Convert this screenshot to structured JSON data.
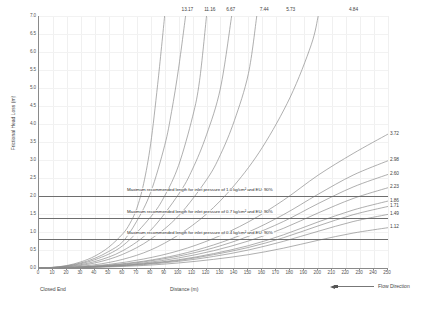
{
  "chart": {
    "type": "line",
    "title": "",
    "xlabel": "Distance (m)",
    "ylabel": "Frictional Head Loss (m)",
    "closed_end_label": "Closed End",
    "xlim": [
      0,
      250
    ],
    "ylim": [
      0,
      7.0
    ],
    "xticks": [
      0,
      10,
      20,
      30,
      40,
      50,
      60,
      70,
      80,
      90,
      100,
      110,
      120,
      130,
      140,
      150,
      160,
      170,
      180,
      190,
      200,
      210,
      220,
      230,
      240,
      250
    ],
    "yticks": [
      "0.0",
      "0.5",
      "1.0",
      "1.5",
      "2.0",
      "2.5",
      "3.0",
      "3.5",
      "4.0",
      "4.5",
      "5.0",
      "5.5",
      "6.0",
      "6.5",
      "7.0"
    ],
    "grid": true,
    "legend_position": "bottom-right",
    "legend": [
      {
        "label": "Flow Direction",
        "icon": "left-arrow-line"
      }
    ],
    "line_color": "#8c8c8c",
    "threshold_color": "#6e6e6e",
    "axis_color": "#8a8a8a",
    "grid_color": "#f0f0f0"
  },
  "chart_data": {
    "type": "line",
    "title": "",
    "xlabel": "Distance (m)",
    "ylabel": "Frictional Head Loss (m)",
    "xlim": [
      0,
      250
    ],
    "ylim": [
      0,
      7.0
    ],
    "grid": true,
    "legend_position": "bottom-right",
    "annotations": [
      {
        "text": "Maximum recommended length for inlet pressure of 1.0 kg/cm² and EU: 90%",
        "y": 2.0,
        "type": "hline"
      },
      {
        "text": "Maximum recommended length for inlet pressure of 0.7 kg/cm² and EU: 90%",
        "y": 1.4,
        "type": "hline"
      },
      {
        "text": "Maximum recommended length for inlet pressure of 0.4 kg/cm² and EU: 90%",
        "y": 0.8,
        "type": "hline"
      }
    ],
    "end_labels_top": [
      "13.17",
      "11.16",
      "6.67",
      "7.44",
      "5.73",
      "4.84"
    ],
    "end_labels_right": [
      "3.72",
      "2.98",
      "2.60",
      "2.23",
      "1.86",
      "1.71",
      "1.49",
      "1.12"
    ],
    "series": [
      {
        "name": "13.17",
        "exit": "top",
        "exit_x": 107,
        "x": [
          0,
          10,
          20,
          30,
          40,
          50,
          60,
          65,
          70,
          75,
          80,
          85,
          90
        ],
        "values": [
          0,
          0.02,
          0.07,
          0.17,
          0.33,
          0.58,
          0.95,
          1.23,
          1.65,
          2.35,
          3.45,
          5.1,
          7.0
        ]
      },
      {
        "name": "11.16",
        "exit": "top",
        "exit_x": 123,
        "x": [
          0,
          10,
          20,
          30,
          40,
          50,
          60,
          70,
          80,
          90,
          95,
          100,
          105
        ],
        "values": [
          0,
          0.015,
          0.06,
          0.14,
          0.27,
          0.46,
          0.73,
          1.3,
          2.1,
          3.4,
          4.35,
          5.55,
          7.0
        ]
      },
      {
        "name": "6.67",
        "exit": "top",
        "exit_x": 138,
        "x": [
          0,
          20,
          40,
          60,
          80,
          90,
          100,
          110,
          115,
          120
        ],
        "values": [
          0,
          0.05,
          0.23,
          0.62,
          1.42,
          2.0,
          2.85,
          4.2,
          5.2,
          7.0
        ]
      },
      {
        "name": "7.44",
        "exit": "top",
        "exit_x": 162,
        "x": [
          0,
          20,
          40,
          60,
          80,
          100,
          110,
          120,
          130,
          138
        ],
        "values": [
          0,
          0.04,
          0.18,
          0.48,
          1.05,
          2.05,
          2.75,
          3.7,
          5.0,
          7.0
        ]
      },
      {
        "name": "5.73",
        "exit": "top",
        "exit_x": 181,
        "x": [
          0,
          20,
          40,
          60,
          80,
          100,
          120,
          130,
          140,
          150,
          156
        ],
        "values": [
          0,
          0.03,
          0.14,
          0.38,
          0.8,
          1.45,
          2.45,
          3.15,
          4.1,
          5.4,
          7.0
        ]
      },
      {
        "name": "4.84",
        "exit": "top",
        "exit_x": 226,
        "x": [
          0,
          20,
          40,
          60,
          80,
          100,
          120,
          140,
          160,
          180,
          195,
          200
        ],
        "values": [
          0,
          0.02,
          0.09,
          0.24,
          0.5,
          0.92,
          1.5,
          2.3,
          3.35,
          4.75,
          6.2,
          7.0
        ]
      },
      {
        "name": "3.72",
        "exit": "right",
        "exit_y": 3.72,
        "x": [
          0,
          25,
          50,
          75,
          100,
          125,
          150,
          175,
          200,
          225,
          250
        ],
        "values": [
          0,
          0.02,
          0.1,
          0.25,
          0.48,
          0.82,
          1.28,
          1.88,
          2.58,
          3.18,
          3.72
        ]
      },
      {
        "name": "2.98",
        "exit": "right",
        "exit_y": 2.98,
        "x": [
          0,
          25,
          50,
          75,
          100,
          125,
          150,
          175,
          200,
          225,
          250
        ],
        "values": [
          0,
          0.015,
          0.08,
          0.19,
          0.37,
          0.64,
          1.0,
          1.48,
          2.05,
          2.58,
          2.98
        ]
      },
      {
        "name": "2.60",
        "exit": "right",
        "exit_y": 2.6,
        "x": [
          0,
          25,
          50,
          75,
          100,
          125,
          150,
          175,
          200,
          225,
          250
        ],
        "values": [
          0,
          0.013,
          0.07,
          0.17,
          0.33,
          0.56,
          0.88,
          1.29,
          1.79,
          2.25,
          2.6
        ]
      },
      {
        "name": "2.23",
        "exit": "right",
        "exit_y": 2.23,
        "x": [
          0,
          25,
          50,
          75,
          100,
          125,
          150,
          175,
          200,
          225,
          250
        ],
        "values": [
          0,
          0.011,
          0.06,
          0.14,
          0.28,
          0.48,
          0.75,
          1.1,
          1.53,
          1.93,
          2.23
        ]
      },
      {
        "name": "1.86",
        "exit": "right",
        "exit_y": 1.86,
        "x": [
          0,
          25,
          50,
          75,
          100,
          125,
          150,
          175,
          200,
          225,
          250
        ],
        "values": [
          0,
          0.009,
          0.05,
          0.12,
          0.23,
          0.4,
          0.62,
          0.92,
          1.28,
          1.61,
          1.86
        ]
      },
      {
        "name": "1.71",
        "exit": "right",
        "exit_y": 1.71,
        "x": [
          0,
          25,
          50,
          75,
          100,
          125,
          150,
          175,
          200,
          225,
          250
        ],
        "values": [
          0,
          0.008,
          0.045,
          0.11,
          0.21,
          0.37,
          0.57,
          0.84,
          1.17,
          1.48,
          1.71
        ]
      },
      {
        "name": "1.49",
        "exit": "right",
        "exit_y": 1.49,
        "x": [
          0,
          25,
          50,
          75,
          100,
          125,
          150,
          175,
          200,
          225,
          250
        ],
        "values": [
          0,
          0.007,
          0.04,
          0.095,
          0.185,
          0.32,
          0.5,
          0.74,
          1.02,
          1.29,
          1.49
        ]
      },
      {
        "name": "1.12",
        "exit": "right",
        "exit_y": 1.12,
        "x": [
          0,
          25,
          50,
          75,
          100,
          125,
          150,
          175,
          200,
          225,
          250
        ],
        "values": [
          0,
          0.005,
          0.03,
          0.07,
          0.14,
          0.24,
          0.37,
          0.55,
          0.77,
          0.97,
          1.12
        ]
      }
    ]
  }
}
